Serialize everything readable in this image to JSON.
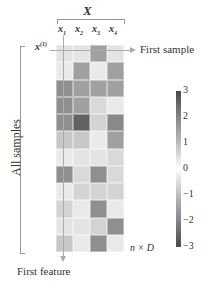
{
  "title": "X",
  "columns": [
    "x",
    "x",
    "x",
    "x"
  ],
  "column_subscripts": [
    "1",
    "2",
    "3",
    "4"
  ],
  "first_row_label": "x",
  "first_row_sup": "(1)",
  "first_sample_label": "First sample",
  "all_samples_label": "All samples",
  "first_feature_label": "First feature",
  "size_label": "n × D",
  "chart_data": {
    "type": "heatmap",
    "title": "X",
    "x_labels": [
      "x1",
      "x2",
      "x3",
      "x4"
    ],
    "rows": 12,
    "values": [
      [
        0.3,
        0.3,
        1.5,
        0.3
      ],
      [
        0.2,
        1.5,
        0.2,
        1.5
      ],
      [
        1.8,
        1.5,
        1.5,
        1.5
      ],
      [
        1.8,
        1.5,
        0.5,
        0.2
      ],
      [
        1.8,
        2.6,
        0.6,
        1.9
      ],
      [
        0.8,
        0.8,
        0.2,
        1.5
      ],
      [
        0.2,
        0.3,
        0.3,
        0.5
      ],
      [
        1.8,
        0.5,
        1.8,
        0.5
      ],
      [
        0.2,
        0.6,
        0.6,
        0.6
      ],
      [
        0.6,
        0.2,
        1.8,
        0.2
      ],
      [
        0.3,
        0.3,
        0.6,
        1.8
      ],
      [
        0.8,
        0.2,
        1.8,
        0.2
      ]
    ],
    "colorbar": {
      "ticks": [
        "3",
        "2",
        "1",
        "0",
        "−1",
        "−2",
        "−3"
      ],
      "range": [
        -3,
        3
      ]
    }
  }
}
